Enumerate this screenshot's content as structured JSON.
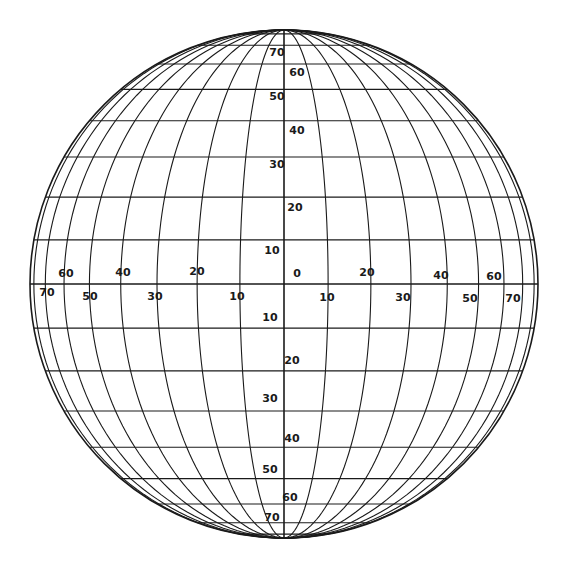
{
  "diagram": {
    "type": "orthographic-globe-graticule",
    "center": [
      284,
      284
    ],
    "radius": 254,
    "line_color": "#1a1a1a",
    "background": "#ffffff",
    "meridian_step_deg": 10,
    "meridian_range_deg": [
      -80,
      80
    ],
    "parallel_step_deg": 10,
    "parallel_range_deg": [
      -80,
      80
    ],
    "central_meridian_labels": [
      {
        "text": "70",
        "x": 277,
        "y": 56
      },
      {
        "text": "60",
        "x": 297,
        "y": 76
      },
      {
        "text": "50",
        "x": 277,
        "y": 100
      },
      {
        "text": "40",
        "x": 297,
        "y": 134
      },
      {
        "text": "30",
        "x": 277,
        "y": 168
      },
      {
        "text": "20",
        "x": 295,
        "y": 211
      },
      {
        "text": "10",
        "x": 272,
        "y": 254
      },
      {
        "text": "0",
        "x": 297,
        "y": 277
      },
      {
        "text": "10",
        "x": 270,
        "y": 321
      },
      {
        "text": "20",
        "x": 292,
        "y": 364
      },
      {
        "text": "30",
        "x": 270,
        "y": 402
      },
      {
        "text": "40",
        "x": 292,
        "y": 442
      },
      {
        "text": "50",
        "x": 270,
        "y": 473
      },
      {
        "text": "60",
        "x": 290,
        "y": 501
      },
      {
        "text": "70",
        "x": 272,
        "y": 521
      }
    ],
    "equator_labels": [
      {
        "text": "70",
        "x": 47,
        "y": 296
      },
      {
        "text": "60",
        "x": 66,
        "y": 277
      },
      {
        "text": "50",
        "x": 90,
        "y": 300
      },
      {
        "text": "40",
        "x": 123,
        "y": 276
      },
      {
        "text": "30",
        "x": 155,
        "y": 300
      },
      {
        "text": "20",
        "x": 197,
        "y": 275
      },
      {
        "text": "10",
        "x": 237,
        "y": 300
      },
      {
        "text": "10",
        "x": 327,
        "y": 301
      },
      {
        "text": "20",
        "x": 367,
        "y": 276
      },
      {
        "text": "30",
        "x": 403,
        "y": 301
      },
      {
        "text": "40",
        "x": 441,
        "y": 279
      },
      {
        "text": "50",
        "x": 470,
        "y": 302
      },
      {
        "text": "60",
        "x": 494,
        "y": 280
      },
      {
        "text": "70",
        "x": 513,
        "y": 302
      }
    ]
  }
}
